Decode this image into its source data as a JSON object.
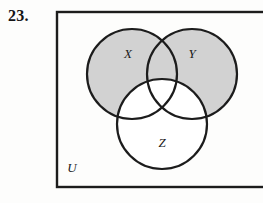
{
  "figure": {
    "exercise_number": "23.",
    "type": "venn-diagram",
    "sets": [
      {
        "id": "X",
        "label": "X",
        "shaded": true,
        "cx": 132,
        "cy": 74,
        "r": 45
      },
      {
        "id": "Y",
        "label": "Y",
        "shaded": true,
        "cx": 192,
        "cy": 74,
        "r": 45
      },
      {
        "id": "Z",
        "label": "Z",
        "shaded": false,
        "cx": 162,
        "cy": 124,
        "r": 45
      }
    ],
    "universe": {
      "label": "U",
      "x": 57,
      "y": 12,
      "width": 212,
      "height": 175
    },
    "labels": {
      "x_label": "X",
      "y_label": "Y",
      "z_label": "Z",
      "universe_label": "U"
    },
    "label_positions": {
      "x": {
        "x": 128,
        "y": 58
      },
      "y": {
        "x": 192,
        "y": 58
      },
      "z": {
        "x": 162,
        "y": 147
      },
      "u": {
        "x": 72,
        "y": 172
      }
    },
    "colors": {
      "shading": "#d2d2d2",
      "stroke": "#1c1c1c",
      "background": "#fdfdfc",
      "unshaded": "#ffffff",
      "text": "#141414"
    },
    "stroke_width": 2.2,
    "border_width": 2.4
  }
}
